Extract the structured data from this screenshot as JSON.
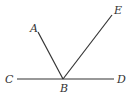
{
  "diagram": {
    "type": "geometry-angles",
    "stroke_color": "#333333",
    "points": {
      "A": {
        "label": "A",
        "x": 38,
        "y": 32,
        "label_x": 30,
        "label_y": 32
      },
      "B": {
        "label": "B",
        "x": 63,
        "y": 79,
        "label_x": 60,
        "label_y": 92
      },
      "C": {
        "label": "C",
        "x": 17,
        "y": 79,
        "label_x": 5,
        "label_y": 83
      },
      "D": {
        "label": "D",
        "x": 114,
        "y": 79,
        "label_x": 117,
        "label_y": 83
      },
      "E": {
        "label": "E",
        "x": 112,
        "y": 15,
        "label_x": 114,
        "label_y": 14
      }
    },
    "segments": [
      {
        "name": "line-CD",
        "from": "C",
        "to": "D"
      },
      {
        "name": "ray-BA",
        "from": "B",
        "to": "A"
      },
      {
        "name": "ray-BE",
        "from": "B",
        "to": "E"
      }
    ]
  }
}
